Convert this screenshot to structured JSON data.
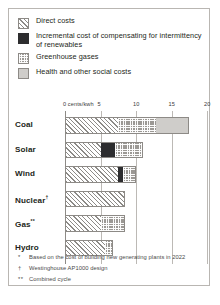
{
  "legend": {
    "items": [
      {
        "label": "Direct costs",
        "pattern": "hatch",
        "color": "#8c8a87"
      },
      {
        "label": "Incremental cost of compensating for intermittency of renewables",
        "pattern": "dark",
        "color": "#2d2d2f"
      },
      {
        "label": "Greenhouse gases",
        "pattern": "dots",
        "color": "#9b9894"
      },
      {
        "label": "Health and other social costs",
        "pattern": "solid",
        "color": "#cfcdca"
      }
    ]
  },
  "axis": {
    "origin_label": "0 cents/kwh",
    "tick_labels": [
      "5",
      "10",
      "15",
      "20"
    ]
  },
  "footnotes": [
    {
      "mark": "*",
      "text": "Based on the cost of building new generating plants in 2022"
    },
    {
      "mark": "†",
      "text": "Westinghouse AP1000 design"
    },
    {
      "mark": "**",
      "text": "Combined cycle"
    }
  ],
  "chart_data": {
    "type": "bar",
    "orientation": "horizontal",
    "stacked": true,
    "title": "",
    "xlabel": "0 cents/kwh",
    "ylabel": "",
    "xlim": [
      0,
      20
    ],
    "xticks": [
      0,
      5,
      10,
      15,
      20
    ],
    "grid": true,
    "legend_position": "top",
    "categories": [
      "Coal",
      "Solar",
      "Wind",
      "Nuclear†",
      "Gas**",
      "Hydro"
    ],
    "series": [
      {
        "name": "Direct costs",
        "values": [
          7.5,
          5.0,
          7.4,
          8.5,
          5.0,
          5.6
        ]
      },
      {
        "name": "Incremental cost of compensating for intermittency of renewables",
        "values": [
          0,
          2.0,
          0.8,
          0,
          0,
          0
        ]
      },
      {
        "name": "Greenhouse gases",
        "values": [
          5.3,
          4.0,
          1.8,
          0,
          3.5,
          1.1
        ]
      },
      {
        "name": "Health and other social costs",
        "values": [
          4.7,
          0,
          0,
          0,
          0,
          0
        ]
      }
    ],
    "totals": [
      17.5,
      11.0,
      10.0,
      8.5,
      8.5,
      6.7
    ]
  }
}
